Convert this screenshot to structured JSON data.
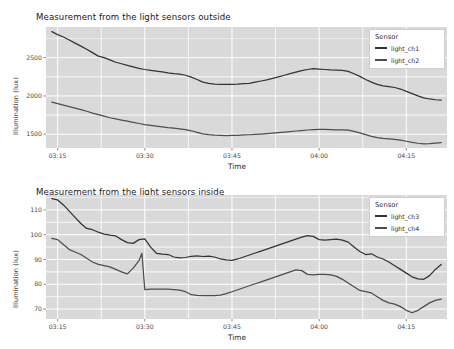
{
  "figure": {
    "width": 454,
    "height": 349,
    "background": "#ffffff",
    "panel_background": "#d9d9d9",
    "grid_color": "#ffffff"
  },
  "chart_data": [
    {
      "type": "line",
      "title": "Measurement from the light sensors outside",
      "xlabel": "Time",
      "ylabel": "Illumination (lux)",
      "grid": true,
      "legend_position": "top-right-inside",
      "legend_title": "Sensor",
      "xticklabels": [
        "03:15",
        "03:30",
        "03:45",
        "04:00",
        "04:15"
      ],
      "xtickvalues": [
        195,
        210,
        225,
        240,
        255
      ],
      "xlim": [
        193,
        262
      ],
      "yticklabels": [
        "1500",
        "2000",
        "2500"
      ],
      "ytickvalues": [
        1500,
        2000,
        2500
      ],
      "ylim": [
        1320,
        2900
      ],
      "series": [
        {
          "name": "light_ch1",
          "color": "#333333",
          "x": [
            194,
            195,
            196,
            197,
            198,
            199,
            200,
            201,
            202,
            203,
            204,
            205,
            206,
            207,
            208,
            209,
            210,
            211,
            212,
            213,
            214,
            215,
            216,
            217,
            218,
            219,
            220,
            221,
            222,
            223,
            224,
            225,
            226,
            227,
            228,
            229,
            230,
            231,
            232,
            233,
            234,
            235,
            236,
            237,
            238,
            239,
            240,
            241,
            242,
            243,
            244,
            245,
            246,
            247,
            248,
            249,
            250,
            251,
            252,
            253,
            254,
            255,
            256,
            257,
            258,
            259,
            260,
            261
          ],
          "values": [
            2840,
            2800,
            2770,
            2730,
            2690,
            2650,
            2610,
            2565,
            2520,
            2500,
            2470,
            2440,
            2420,
            2400,
            2380,
            2360,
            2345,
            2335,
            2325,
            2315,
            2300,
            2290,
            2285,
            2270,
            2245,
            2215,
            2180,
            2165,
            2155,
            2152,
            2150,
            2152,
            2155,
            2160,
            2165,
            2180,
            2195,
            2210,
            2230,
            2250,
            2270,
            2290,
            2310,
            2330,
            2345,
            2355,
            2350,
            2345,
            2340,
            2338,
            2335,
            2320,
            2290,
            2255,
            2215,
            2180,
            2150,
            2130,
            2120,
            2110,
            2090,
            2060,
            2030,
            2000,
            1975,
            1960,
            1950,
            1945
          ]
        },
        {
          "name": "light_ch2",
          "color": "#4d4d4d",
          "x": [
            194,
            195,
            196,
            197,
            198,
            199,
            200,
            201,
            202,
            203,
            204,
            205,
            206,
            207,
            208,
            209,
            210,
            211,
            212,
            213,
            214,
            215,
            216,
            217,
            218,
            219,
            220,
            221,
            222,
            223,
            224,
            225,
            226,
            227,
            228,
            229,
            230,
            231,
            232,
            233,
            234,
            235,
            236,
            237,
            238,
            239,
            240,
            241,
            242,
            243,
            244,
            245,
            246,
            247,
            248,
            249,
            250,
            251,
            252,
            253,
            254,
            255,
            256,
            257,
            258,
            259,
            260,
            261
          ],
          "values": [
            1920,
            1900,
            1880,
            1860,
            1840,
            1820,
            1800,
            1775,
            1755,
            1735,
            1715,
            1700,
            1685,
            1670,
            1655,
            1640,
            1625,
            1615,
            1605,
            1595,
            1585,
            1578,
            1570,
            1560,
            1545,
            1525,
            1505,
            1495,
            1488,
            1485,
            1483,
            1484,
            1486,
            1490,
            1493,
            1497,
            1502,
            1508,
            1515,
            1522,
            1528,
            1535,
            1542,
            1548,
            1555,
            1560,
            1562,
            1562,
            1560,
            1558,
            1558,
            1552,
            1538,
            1518,
            1495,
            1472,
            1455,
            1445,
            1438,
            1432,
            1422,
            1408,
            1393,
            1382,
            1375,
            1378,
            1385,
            1390
          ]
        }
      ]
    },
    {
      "type": "line",
      "title": "Measurement from the light sensors inside",
      "xlabel": "Time",
      "ylabel": "Illumination (lux)",
      "grid": true,
      "legend_position": "top-right-inside",
      "legend_title": "Sensor",
      "xticklabels": [
        "03:15",
        "03:30",
        "03:45",
        "04:00",
        "04:15"
      ],
      "xtickvalues": [
        195,
        210,
        225,
        240,
        255
      ],
      "xlim": [
        193,
        262
      ],
      "yticklabels": [
        "70",
        "80",
        "90",
        "100",
        "110"
      ],
      "ytickvalues": [
        70,
        80,
        90,
        100,
        110
      ],
      "ylim": [
        66,
        116
      ],
      "series": [
        {
          "name": "light_ch3",
          "color": "#333333",
          "x": [
            194,
            195,
            196,
            197,
            198,
            199,
            200,
            201,
            202,
            203,
            204,
            205,
            206,
            207,
            208,
            209,
            210,
            211,
            212,
            213,
            214,
            215,
            216,
            217,
            218,
            219,
            220,
            221,
            222,
            223,
            224,
            225,
            226,
            227,
            228,
            229,
            230,
            231,
            232,
            233,
            234,
            235,
            236,
            237,
            238,
            239,
            240,
            241,
            242,
            243,
            244,
            245,
            246,
            247,
            248,
            249,
            250,
            251,
            252,
            253,
            254,
            255,
            256,
            257,
            258,
            259,
            260,
            261
          ],
          "values": [
            114.5,
            114.0,
            112.0,
            109.5,
            107.0,
            104.5,
            102.5,
            102.0,
            101.0,
            100.2,
            99.8,
            99.5,
            98.0,
            96.8,
            96.5,
            98.0,
            98.3,
            95.0,
            92.5,
            92.2,
            92.0,
            91.0,
            90.6,
            90.8,
            91.3,
            91.5,
            91.2,
            91.4,
            91.0,
            90.2,
            89.8,
            89.6,
            90.2,
            91.0,
            91.8,
            92.6,
            93.4,
            94.2,
            95.0,
            95.8,
            96.6,
            97.4,
            98.2,
            99.0,
            99.6,
            99.3,
            98.0,
            97.8,
            98.0,
            98.2,
            97.8,
            97.0,
            95.0,
            93.2,
            92.0,
            92.3,
            91.0,
            90.2,
            89.0,
            87.5,
            86.0,
            84.5,
            83.0,
            82.2,
            82.0,
            83.5,
            86.0,
            88.0
          ]
        },
        {
          "name": "light_ch4",
          "color": "#4d4d4d",
          "x": [
            194,
            195,
            196,
            197,
            198,
            199,
            200,
            201,
            202,
            203,
            204,
            205,
            206,
            207,
            208,
            209,
            209.5,
            210,
            211,
            212,
            213,
            214,
            215,
            216,
            217,
            218,
            219,
            220,
            221,
            222,
            223,
            224,
            225,
            226,
            227,
            228,
            229,
            230,
            231,
            232,
            233,
            234,
            235,
            236,
            237,
            238,
            239,
            240,
            241,
            242,
            243,
            244,
            245,
            246,
            247,
            248,
            249,
            250,
            251,
            252,
            253,
            254,
            255,
            256,
            257,
            258,
            259,
            260,
            261
          ],
          "values": [
            98.5,
            98.0,
            96.0,
            94.0,
            93.0,
            92.0,
            90.5,
            89.0,
            88.0,
            87.5,
            87.0,
            86.0,
            85.0,
            84.2,
            86.5,
            89.5,
            92.5,
            77.8,
            78.0,
            78.0,
            78.0,
            78.0,
            77.8,
            77.6,
            77.0,
            75.8,
            75.5,
            75.4,
            75.4,
            75.4,
            75.6,
            76.2,
            77.0,
            77.8,
            78.6,
            79.4,
            80.2,
            81.0,
            81.8,
            82.6,
            83.4,
            84.2,
            85.0,
            85.8,
            85.5,
            84.0,
            83.8,
            84.0,
            84.0,
            83.8,
            83.2,
            82.0,
            80.5,
            79.0,
            77.5,
            77.0,
            76.5,
            75.0,
            73.5,
            72.5,
            72.0,
            71.0,
            69.5,
            68.5,
            69.5,
            71.0,
            72.5,
            73.5,
            74.0
          ]
        }
      ]
    }
  ]
}
